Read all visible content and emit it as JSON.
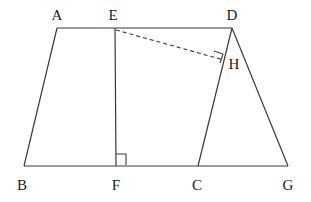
{
  "figure": {
    "background_color": "#ffffff",
    "stroke_color": "#3a3a3a",
    "label_color": "#1a1a1a",
    "stroke_width": 1,
    "dash_pattern": "4 3",
    "labels": {
      "a": "A",
      "e": "E",
      "d": "D",
      "h": "H",
      "b": "B",
      "f": "F",
      "c": "C",
      "g": "G"
    },
    "label_positions": {
      "a": {
        "x": 57,
        "y": 15
      },
      "e": {
        "x": 113,
        "y": 15
      },
      "d": {
        "x": 232,
        "y": 15
      },
      "h": {
        "x": 234,
        "y": 64
      },
      "b": {
        "x": 22,
        "y": 185
      },
      "f": {
        "x": 116,
        "y": 185
      },
      "c": {
        "x": 197,
        "y": 185
      },
      "g": {
        "x": 288,
        "y": 185
      }
    },
    "points": {
      "a": {
        "x": 57,
        "y": 28
      },
      "e": {
        "x": 115,
        "y": 28
      },
      "d": {
        "x": 232,
        "y": 28
      },
      "h": {
        "x": 222,
        "y": 58
      },
      "b": {
        "x": 24,
        "y": 166
      },
      "f": {
        "x": 116,
        "y": 166
      },
      "c": {
        "x": 198,
        "y": 166
      },
      "g": {
        "x": 288,
        "y": 166
      }
    },
    "segments": [
      {
        "name": "segment-a-d",
        "from": "a",
        "to": "d",
        "style": "solid"
      },
      {
        "name": "segment-a-b",
        "from": "a",
        "to": "b",
        "style": "solid"
      },
      {
        "name": "segment-b-g",
        "from": "b",
        "to": "g",
        "style": "solid"
      },
      {
        "name": "segment-e-f",
        "from": "e",
        "to": "f",
        "style": "solid"
      },
      {
        "name": "segment-d-c",
        "from": "d",
        "to": "c",
        "style": "solid"
      },
      {
        "name": "segment-d-g",
        "from": "d",
        "to": "g",
        "style": "solid"
      },
      {
        "name": "segment-e-h",
        "from": "e",
        "to": "h",
        "style": "dashed"
      }
    ],
    "right_angle_marks": [
      {
        "name": "right-angle-mark-f",
        "path": "M 116 154 L 126 154 L 126 164"
      },
      {
        "name": "right-angle-mark-h",
        "path": "M 215 52 L 224 55 L 221 64"
      }
    ]
  }
}
